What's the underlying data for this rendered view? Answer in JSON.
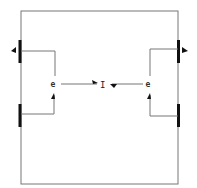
{
  "diagram": {
    "type": "block-diagram",
    "center_label": "I",
    "left_junction_label": "e",
    "right_junction_label": "e",
    "colors": {
      "wire": "#777777",
      "bar": "#111111",
      "background": "#ffffff"
    },
    "elements": [
      {
        "id": "outer-frame",
        "kind": "rectangle"
      },
      {
        "id": "left-upper-port",
        "kind": "thick-bar",
        "side": "left"
      },
      {
        "id": "left-lower-port",
        "kind": "thick-bar",
        "side": "left"
      },
      {
        "id": "right-upper-port",
        "kind": "thick-bar",
        "side": "right"
      },
      {
        "id": "right-lower-port",
        "kind": "thick-bar",
        "side": "right"
      },
      {
        "id": "left-junction",
        "kind": "node"
      },
      {
        "id": "right-junction",
        "kind": "node"
      },
      {
        "id": "center-node",
        "kind": "label"
      }
    ]
  }
}
